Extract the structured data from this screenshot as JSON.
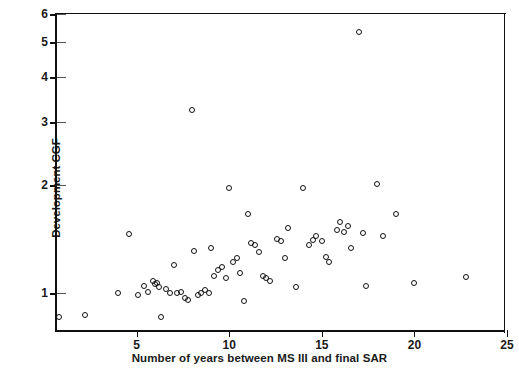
{
  "chart_data": {
    "type": "scatter",
    "title": "",
    "xlabel": "Number of years between MS III and final SAR",
    "ylabel": "Development CGF",
    "xlim": [
      0.7,
      25
    ],
    "ylim": [
      0.78,
      6
    ],
    "yscale": "log",
    "xscale": "linear",
    "grid": false,
    "legend": null,
    "xticks": [
      5,
      10,
      15,
      20,
      25
    ],
    "xticklabels": [
      "5",
      "10",
      "15",
      "20",
      "25"
    ],
    "yticks": [
      1,
      2,
      3,
      4,
      5,
      6
    ],
    "yticklabels": [
      "1",
      "2",
      "3",
      "4",
      "5",
      "6"
    ],
    "marker": "open-circle",
    "marker_color": "#111111",
    "points": [
      {
        "x": 0.8,
        "y": 0.86
      },
      {
        "x": 2.2,
        "y": 0.87
      },
      {
        "x": 4.0,
        "y": 1.0
      },
      {
        "x": 4.6,
        "y": 1.46
      },
      {
        "x": 5.1,
        "y": 0.99
      },
      {
        "x": 5.4,
        "y": 1.05
      },
      {
        "x": 5.6,
        "y": 1.01
      },
      {
        "x": 5.9,
        "y": 1.08
      },
      {
        "x": 6.0,
        "y": 1.06
      },
      {
        "x": 6.1,
        "y": 1.07
      },
      {
        "x": 6.2,
        "y": 1.04
      },
      {
        "x": 6.3,
        "y": 0.86
      },
      {
        "x": 6.6,
        "y": 1.03
      },
      {
        "x": 6.8,
        "y": 1.0
      },
      {
        "x": 7.0,
        "y": 1.2
      },
      {
        "x": 7.2,
        "y": 1.0
      },
      {
        "x": 7.4,
        "y": 1.01
      },
      {
        "x": 7.6,
        "y": 0.97
      },
      {
        "x": 7.8,
        "y": 0.96
      },
      {
        "x": 8.0,
        "y": 3.25
      },
      {
        "x": 8.1,
        "y": 1.31
      },
      {
        "x": 8.3,
        "y": 0.99
      },
      {
        "x": 8.5,
        "y": 1.0
      },
      {
        "x": 8.7,
        "y": 1.02
      },
      {
        "x": 8.9,
        "y": 1.0
      },
      {
        "x": 9.0,
        "y": 1.34
      },
      {
        "x": 9.2,
        "y": 1.12
      },
      {
        "x": 9.4,
        "y": 1.16
      },
      {
        "x": 9.6,
        "y": 1.18
      },
      {
        "x": 9.8,
        "y": 1.1
      },
      {
        "x": 10.0,
        "y": 1.96
      },
      {
        "x": 10.2,
        "y": 1.22
      },
      {
        "x": 10.4,
        "y": 1.25
      },
      {
        "x": 10.6,
        "y": 1.14
      },
      {
        "x": 10.8,
        "y": 0.95
      },
      {
        "x": 11.0,
        "y": 1.66
      },
      {
        "x": 11.2,
        "y": 1.38
      },
      {
        "x": 11.4,
        "y": 1.36
      },
      {
        "x": 11.6,
        "y": 1.3
      },
      {
        "x": 11.8,
        "y": 1.12
      },
      {
        "x": 12.0,
        "y": 1.1
      },
      {
        "x": 12.2,
        "y": 1.08
      },
      {
        "x": 12.6,
        "y": 1.42
      },
      {
        "x": 12.8,
        "y": 1.4
      },
      {
        "x": 13.0,
        "y": 1.25
      },
      {
        "x": 13.2,
        "y": 1.52
      },
      {
        "x": 13.6,
        "y": 1.04
      },
      {
        "x": 14.0,
        "y": 1.96
      },
      {
        "x": 14.3,
        "y": 1.36
      },
      {
        "x": 14.5,
        "y": 1.41
      },
      {
        "x": 14.7,
        "y": 1.44
      },
      {
        "x": 15.0,
        "y": 1.4
      },
      {
        "x": 15.2,
        "y": 1.26
      },
      {
        "x": 15.4,
        "y": 1.22
      },
      {
        "x": 15.8,
        "y": 1.5
      },
      {
        "x": 16.0,
        "y": 1.58
      },
      {
        "x": 16.2,
        "y": 1.48
      },
      {
        "x": 16.4,
        "y": 1.54
      },
      {
        "x": 16.6,
        "y": 1.34
      },
      {
        "x": 17.0,
        "y": 5.35
      },
      {
        "x": 17.2,
        "y": 1.47
      },
      {
        "x": 17.4,
        "y": 1.05
      },
      {
        "x": 18.0,
        "y": 2.02
      },
      {
        "x": 18.3,
        "y": 1.44
      },
      {
        "x": 19.0,
        "y": 1.66
      },
      {
        "x": 20.0,
        "y": 1.07
      },
      {
        "x": 22.8,
        "y": 1.11
      }
    ]
  }
}
